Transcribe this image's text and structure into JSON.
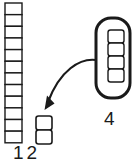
{
  "diagram": {
    "background_color": "#ffffff",
    "stroke_color": "#1a1a1a",
    "fill_color": "#ffffff",
    "labels": {
      "ones_column": "12",
      "group_of_four": "4"
    },
    "ones_column": {
      "name": "twelve-unit-column",
      "count": 12,
      "x": 5,
      "y": 3,
      "cell_width": 17,
      "cell_height": 11.65,
      "stroke_width": 1.4
    },
    "remainder_stack": {
      "name": "two-unit-stack",
      "count": 2,
      "x": 36,
      "y": 116,
      "cell_width": 16,
      "cell_height": 14,
      "corner_radius": 2.5,
      "stroke_width": 1.6
    },
    "group_container": {
      "name": "group-of-four-container",
      "count": 4,
      "x": 96,
      "y": 18,
      "width": 34,
      "height": 80,
      "corner_radius": 15,
      "stroke_width": 3,
      "inner_x": 108,
      "inner_y": 30,
      "inner_width": 16,
      "inner_height": 13,
      "inner_corner_radius": 2.5,
      "inner_stroke_width": 1.4
    },
    "arrow": {
      "name": "regrouping-arrow",
      "path": "M 96 60 C 80 58 60 70 48 102",
      "stroke_width": 2.2,
      "head_points": "45,109 46.5,96.5 53,103",
      "start_x": 96,
      "start_y": 60,
      "tip_x": 45,
      "tip_y": 109
    }
  }
}
